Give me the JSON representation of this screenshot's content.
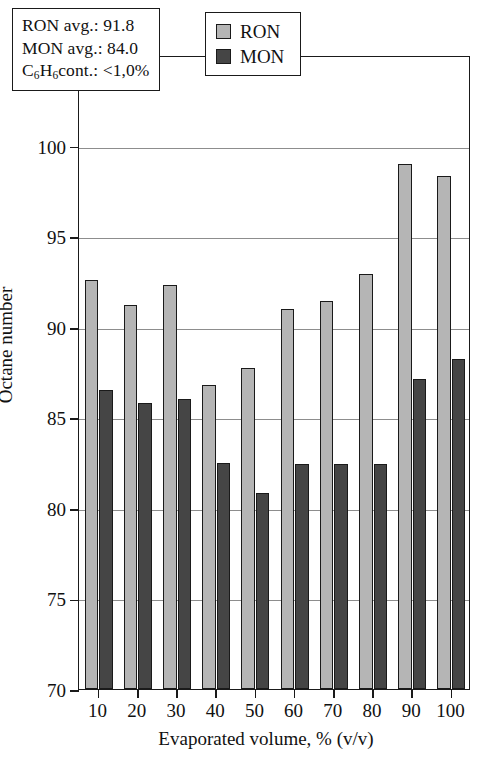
{
  "panel_label": "(b)",
  "chart_data": {
    "type": "bar",
    "title": "",
    "xlabel": "Evaporated volume, % (v/v)",
    "ylabel": "Octane number",
    "categories": [
      "10",
      "20",
      "30",
      "40",
      "50",
      "60",
      "70",
      "80",
      "90",
      "100"
    ],
    "ylim": [
      70,
      105
    ],
    "ytick_step": 5,
    "yticks": [
      "70",
      "75",
      "80",
      "85",
      "90",
      "95",
      "100",
      "105"
    ],
    "grid": true,
    "grid_axis": "y",
    "legend_position": "top-center",
    "series": [
      {
        "name": "RON",
        "color": "#b5b5b5",
        "values": [
          92.6,
          91.2,
          92.3,
          86.8,
          87.7,
          91.0,
          91.4,
          92.9,
          99.0,
          98.3
        ]
      },
      {
        "name": "MON",
        "color": "#454545",
        "values": [
          86.5,
          85.8,
          86.0,
          82.5,
          80.8,
          82.4,
          82.4,
          82.4,
          87.1,
          88.2
        ]
      }
    ],
    "annotations": [
      "RON avg.: 91.8",
      "MON avg.: 84.0",
      "C6H6cont.: <1,0%"
    ]
  },
  "annotation_box": {
    "line1": "RON avg.: 91.8",
    "line2": "MON avg.: 84.0",
    "line3_pre": "C",
    "line3_sub1": "6",
    "line3_mid": "H",
    "line3_sub2": "6",
    "line3_post": "cont.: <1,0%"
  },
  "legend": {
    "ron_label": "RON",
    "mon_label": "MON"
  }
}
